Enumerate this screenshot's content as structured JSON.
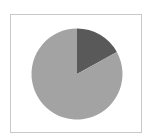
{
  "chart_data": {
    "type": "pie",
    "title": "",
    "categories": [
      "Slice A",
      "Slice B"
    ],
    "values": [
      17,
      83
    ],
    "colors": [
      "#595959",
      "#a3a3a3"
    ],
    "start_angle_deg": 0,
    "direction": "clockwise",
    "legend": "none",
    "data_labels": "none"
  },
  "frame": {
    "border_color": "#c8c8c8"
  }
}
